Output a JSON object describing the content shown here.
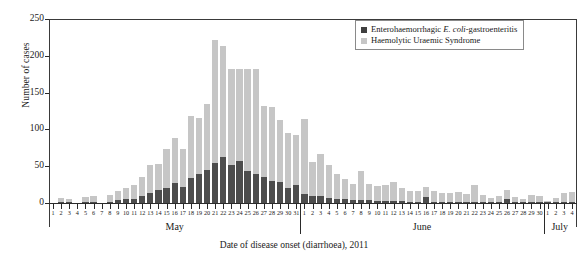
{
  "chart_data": {
    "type": "bar",
    "title": "",
    "subtitle": "",
    "xlabel": "Date of disease onset (diarrhoea), 2011",
    "ylabel": "Number of cases",
    "ylim": [
      0,
      250
    ],
    "yticks": [
      0,
      50,
      100,
      150,
      200,
      250
    ],
    "grid": false,
    "stacked": true,
    "legend_position": "top-right",
    "legend": [
      {
        "label": "Enterohaemorrhagic E. coli-gastroenteritis",
        "color": "#3f3f3f"
      },
      {
        "label": "Haemolytic Uraemic Syndrome",
        "color": "#c6c6c6"
      }
    ],
    "months": [
      {
        "name": "May",
        "days": 31
      },
      {
        "name": "June",
        "days": 30
      },
      {
        "name": "July",
        "days": 4
      }
    ],
    "categories": [
      "May 1",
      "May 2",
      "May 3",
      "May 4",
      "May 5",
      "May 6",
      "May 7",
      "May 8",
      "May 9",
      "May 10",
      "May 11",
      "May 12",
      "May 13",
      "May 14",
      "May 15",
      "May 16",
      "May 17",
      "May 18",
      "May 19",
      "May 20",
      "May 21",
      "May 22",
      "May 23",
      "May 24",
      "May 25",
      "May 26",
      "May 27",
      "May 28",
      "May 29",
      "May 30",
      "May 31",
      "Jun 1",
      "Jun 2",
      "Jun 3",
      "Jun 4",
      "Jun 5",
      "Jun 6",
      "Jun 7",
      "Jun 8",
      "Jun 9",
      "Jun 10",
      "Jun 11",
      "Jun 12",
      "Jun 13",
      "Jun 14",
      "Jun 15",
      "Jun 16",
      "Jun 17",
      "Jun 18",
      "Jun 19",
      "Jun 20",
      "Jun 21",
      "Jun 22",
      "Jun 23",
      "Jun 24",
      "Jun 25",
      "Jun 26",
      "Jun 27",
      "Jun 28",
      "Jun 29",
      "Jun 30",
      "Jul 1",
      "Jul 2",
      "Jul 3",
      "Jul 4"
    ],
    "day_labels": [
      "1",
      "2",
      "3",
      "4",
      "5",
      "6",
      "7",
      "8",
      "9",
      "10",
      "11",
      "12",
      "13",
      "14",
      "15",
      "16",
      "17",
      "18",
      "19",
      "20",
      "21",
      "22",
      "23",
      "24",
      "25",
      "26",
      "27",
      "28",
      "29",
      "30",
      "31",
      "1",
      "2",
      "3",
      "4",
      "5",
      "6",
      "7",
      "8",
      "9",
      "10",
      "11",
      "12",
      "13",
      "14",
      "15",
      "16",
      "17",
      "18",
      "19",
      "20",
      "21",
      "22",
      "23",
      "24",
      "25",
      "26",
      "27",
      "28",
      "29",
      "30",
      "1",
      "2",
      "3",
      "4"
    ],
    "series": [
      {
        "name": "Enterohaemorrhagic E. coli-gastroenteritis",
        "color": "#4d4d4d",
        "values": [
          0,
          1,
          1,
          0,
          1,
          2,
          0,
          2,
          4,
          5,
          6,
          9,
          14,
          17,
          20,
          27,
          22,
          34,
          40,
          45,
          55,
          62,
          52,
          57,
          44,
          40,
          36,
          30,
          28,
          20,
          24,
          12,
          10,
          9,
          7,
          5,
          5,
          4,
          4,
          4,
          3,
          3,
          3,
          3,
          2,
          2,
          8,
          2,
          2,
          2,
          2,
          2,
          2,
          2,
          2,
          2,
          6,
          2,
          1,
          1,
          1,
          1,
          1,
          1,
          1
        ]
      },
      {
        "name": "Haemolytic Uraemic Syndrome",
        "color": "#c6c6c6",
        "values": [
          0,
          6,
          4,
          0,
          7,
          8,
          0,
          9,
          13,
          16,
          18,
          26,
          38,
          36,
          53,
          61,
          52,
          84,
          75,
          90,
          167,
          151,
          130,
          125,
          138,
          142,
          96,
          101,
          85,
          75,
          68,
          102,
          46,
          57,
          45,
          34,
          28,
          22,
          40,
          22,
          20,
          22,
          26,
          18,
          15,
          14,
          14,
          15,
          12,
          11,
          13,
          10,
          22,
          9,
          5,
          8,
          12,
          6,
          5,
          10,
          8,
          2,
          6,
          12,
          14
        ]
      }
    ],
    "totals": [
      0,
      7,
      5,
      0,
      8,
      10,
      0,
      11,
      17,
      21,
      24,
      35,
      52,
      53,
      73,
      88,
      74,
      118,
      115,
      135,
      222,
      213,
      182,
      182,
      182,
      182,
      132,
      131,
      113,
      95,
      92,
      114,
      56,
      66,
      52,
      39,
      33,
      26,
      44,
      26,
      23,
      25,
      29,
      21,
      17,
      16,
      22,
      17,
      14,
      13,
      15,
      12,
      24,
      11,
      7,
      10,
      18,
      8,
      6,
      11,
      9,
      3,
      7,
      13,
      15
    ]
  }
}
